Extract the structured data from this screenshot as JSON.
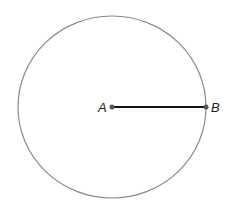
{
  "diagram": {
    "type": "circle-with-radius",
    "circle": {
      "cx": 112,
      "cy": 107,
      "rx": 94,
      "ry": 91,
      "stroke": "#8a8a8a"
    },
    "segment": {
      "from": "A",
      "to": "B",
      "stroke": "#111111"
    },
    "points": [
      {
        "label": "A",
        "x": 112,
        "y": 107
      },
      {
        "label": "B",
        "x": 206,
        "y": 107
      }
    ],
    "labels": {
      "a": "A",
      "b": "B"
    }
  }
}
